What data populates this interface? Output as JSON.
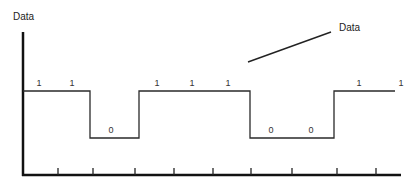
{
  "title": "Data",
  "annotation": {
    "label": "Data"
  },
  "bits": [
    {
      "value": "1",
      "x": 39,
      "y": 79
    },
    {
      "value": "1",
      "x": 72,
      "y": 79
    },
    {
      "value": "0",
      "x": 111,
      "y": 126
    },
    {
      "value": "1",
      "x": 157,
      "y": 79
    },
    {
      "value": "1",
      "x": 192,
      "y": 79
    },
    {
      "value": "1",
      "x": 228,
      "y": 79
    },
    {
      "value": "0",
      "x": 271,
      "y": 126
    },
    {
      "value": "0",
      "x": 311,
      "y": 126
    },
    {
      "value": "1",
      "x": 359,
      "y": 79
    },
    {
      "value": "1",
      "x": 401,
      "y": 79
    }
  ],
  "colors": {
    "line": "#2a2a2a",
    "axis": "#111111"
  }
}
